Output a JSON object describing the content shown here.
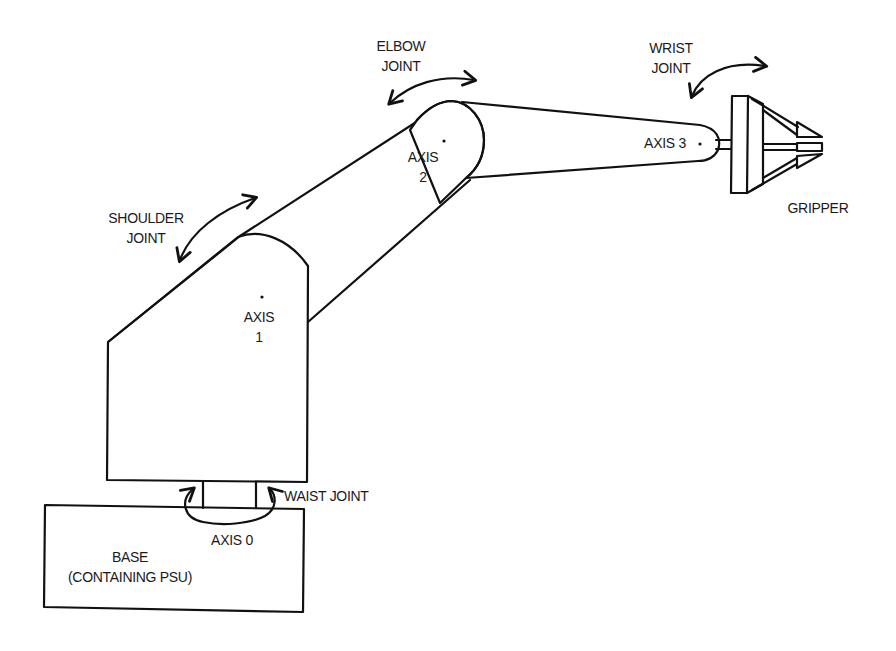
{
  "diagram": {
    "colors": {
      "line": "#111111",
      "background": "#ffffff"
    },
    "labels": {
      "elbow_joint": [
        "ELBOW",
        "JOINT"
      ],
      "wrist_joint": [
        "WRIST",
        "JOINT"
      ],
      "shoulder_joint": [
        "SHOULDER",
        "JOINT"
      ],
      "axis_2": [
        "AXIS",
        "2"
      ],
      "axis_3": "AXIS 3",
      "axis_1": [
        "AXIS",
        "1"
      ],
      "gripper": "GRIPPER",
      "waist_joint": "WAIST JOINT",
      "axis_0": "AXIS 0",
      "base": [
        "BASE",
        "(CONTAINING PSU)"
      ]
    },
    "components": [
      {
        "id": "base",
        "label": "BASE (CONTAINING PSU)"
      },
      {
        "id": "waist",
        "label": "WAIST JOINT",
        "axis": "AXIS 0"
      },
      {
        "id": "shoulder",
        "label": "SHOULDER JOINT",
        "axis": "AXIS 1"
      },
      {
        "id": "elbow",
        "label": "ELBOW JOINT",
        "axis": "AXIS 2"
      },
      {
        "id": "wrist",
        "label": "WRIST JOINT",
        "axis": "AXIS 3"
      },
      {
        "id": "gripper",
        "label": "GRIPPER"
      }
    ]
  }
}
